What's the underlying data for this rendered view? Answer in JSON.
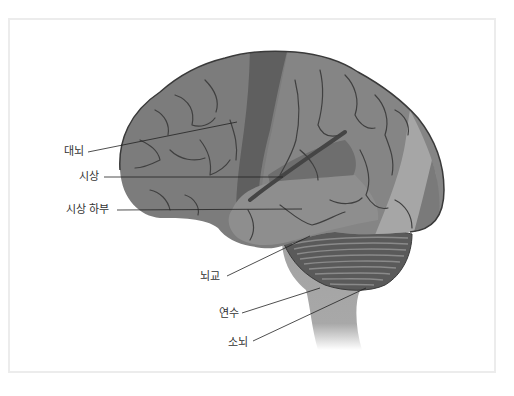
{
  "diagram": {
    "type": "labeled anatomical diagram",
    "labels": [
      {
        "id": "cerebrum",
        "text": "대뇌"
      },
      {
        "id": "thalamus",
        "text": "시상"
      },
      {
        "id": "hypothalamus",
        "text": "시상 하부"
      },
      {
        "id": "pons",
        "text": "뇌교"
      },
      {
        "id": "medulla",
        "text": "연수"
      },
      {
        "id": "cerebellum",
        "text": "소뇌"
      }
    ],
    "colors": {
      "frontal": "#7a7a7a",
      "motor_strip": "#5f5f5f",
      "parietal": "#858585",
      "temporal": "#8e8e8e",
      "occipital_light": "#a6a6a6",
      "cerebellum": "#5a5a5a",
      "brainstem": "#a3a3a3",
      "outline": "#3a3a3a",
      "frame_border": "#ececec"
    }
  }
}
